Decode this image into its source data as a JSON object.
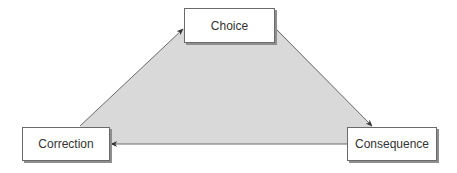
{
  "diagram": {
    "type": "cycle",
    "fill_color": "#d9d9d9",
    "line_color": "#6a6a6a",
    "nodes": [
      {
        "id": "choice",
        "label": "Choice"
      },
      {
        "id": "consequence",
        "label": "Consequence"
      },
      {
        "id": "correction",
        "label": "Correction"
      }
    ],
    "edges": [
      {
        "from": "correction",
        "to": "choice"
      },
      {
        "from": "choice",
        "to": "consequence"
      },
      {
        "from": "consequence",
        "to": "correction"
      }
    ]
  }
}
